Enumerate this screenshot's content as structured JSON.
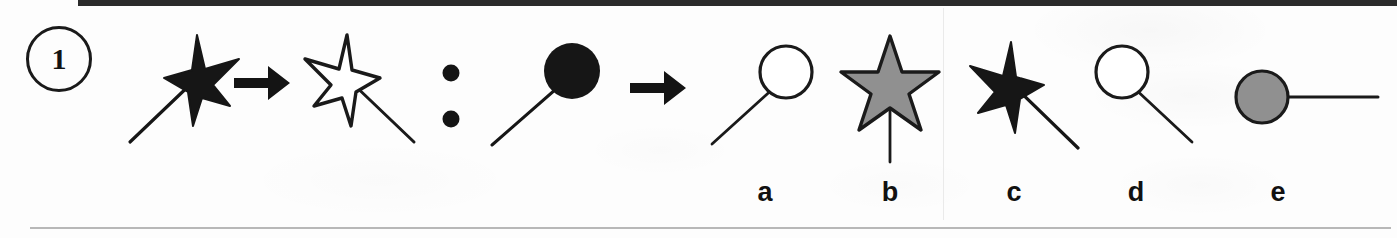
{
  "item": {
    "number": "1",
    "type": "visual-analogy",
    "rule_description": "wand rotated / mirrored"
  },
  "separators": {
    "arrow_glyph": "→",
    "colon_glyph": ":"
  },
  "colors": {
    "ink": "#1a1a1a",
    "black_fill": "#161616",
    "gray_fill": "#909090",
    "white_fill": "#ffffff",
    "paper": "#fdfdfd",
    "top_rule": "#2b2b2b",
    "bottom_rule": "#b8b8b8"
  },
  "stem": {
    "a_figure": {
      "name": "black-star-wand-down-left",
      "shape": "star",
      "fill": "black",
      "handle_direction": "down-left"
    },
    "arrow_1": {
      "name": "analogy-arrow-1",
      "glyph": "→"
    },
    "b_figure": {
      "name": "white-star-wand-down-right",
      "shape": "star",
      "fill": "white",
      "handle_direction": "down-right"
    },
    "colon": {
      "name": "analogy-colon",
      "glyph": ":"
    },
    "c_figure": {
      "name": "black-circle-wand-down-left",
      "shape": "circle",
      "fill": "black",
      "handle_direction": "down-left"
    },
    "arrow_2": {
      "name": "analogy-arrow-2",
      "glyph": "→"
    }
  },
  "options": [
    {
      "label": "a",
      "name": "option-a",
      "shape": "circle",
      "fill": "white",
      "handle_direction": "down-left",
      "description": "unfilled circle with handle to lower-left"
    },
    {
      "label": "b",
      "name": "option-b",
      "shape": "star",
      "fill": "gray",
      "handle_direction": "down",
      "description": "gray star with vertical handle"
    },
    {
      "label": "c",
      "name": "option-c",
      "shape": "star",
      "fill": "black",
      "handle_direction": "down-right",
      "description": "black star with handle to lower-right"
    },
    {
      "label": "d",
      "name": "option-d",
      "shape": "circle",
      "fill": "white",
      "handle_direction": "down-right",
      "description": "unfilled circle with handle to lower-right"
    },
    {
      "label": "e",
      "name": "option-e",
      "shape": "circle",
      "fill": "gray",
      "handle_direction": "right",
      "description": "gray circle with horizontal handle to the right"
    }
  ]
}
